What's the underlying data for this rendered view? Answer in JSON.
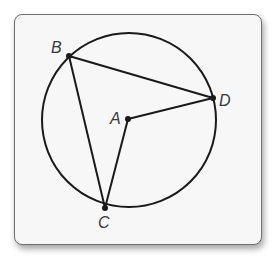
{
  "diagram": {
    "type": "circle-inscribed-angles",
    "circle": {
      "center": "A",
      "cx": 129,
      "cy": 120,
      "r": 87
    },
    "points": [
      {
        "name": "A",
        "label": "A",
        "x": 128,
        "y": 119,
        "label_x": 110,
        "label_y": 124,
        "role": "center"
      },
      {
        "name": "B",
        "label": "B",
        "x": 69,
        "y": 56,
        "label_x": 51,
        "label_y": 53,
        "role": "on-circle"
      },
      {
        "name": "C",
        "label": "C",
        "x": 105,
        "y": 208,
        "label_x": 98,
        "label_y": 228,
        "role": "on-circle"
      },
      {
        "name": "D",
        "label": "D",
        "x": 213,
        "y": 98,
        "label_x": 219,
        "label_y": 106,
        "role": "on-circle"
      }
    ],
    "segments": [
      {
        "from": "B",
        "to": "D"
      },
      {
        "from": "B",
        "to": "C"
      },
      {
        "from": "A",
        "to": "D"
      },
      {
        "from": "A",
        "to": "C"
      }
    ],
    "colors": {
      "stroke": "#1a1a1a",
      "frame_border": "#6f6f6f",
      "frame_fill": "#f7f7f7",
      "label": "#3a3a3a"
    }
  }
}
